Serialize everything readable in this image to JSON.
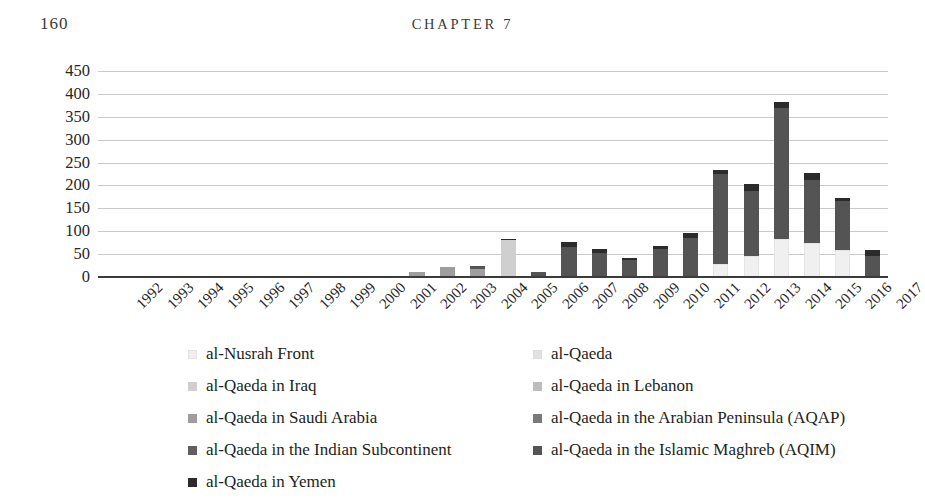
{
  "page": {
    "folio": "160",
    "running_head": "CHAPTER 7"
  },
  "chart_data": {
    "type": "bar",
    "subtype": "stacked-vertical",
    "title": "",
    "subtitle": "",
    "xlabel": "",
    "ylabel": "",
    "ylim": [
      0,
      450
    ],
    "ytick_step": 50,
    "yticks": [
      "450",
      "400",
      "350",
      "300",
      "250",
      "200",
      "150",
      "100",
      "50",
      "0"
    ],
    "grid": true,
    "legend_position": "bottom",
    "legend_columns": 2,
    "categories": [
      "1992",
      "1993",
      "1994",
      "1995",
      "1996",
      "1997",
      "1998",
      "1999",
      "2000",
      "2001",
      "2002",
      "2003",
      "2004",
      "2005",
      "2006",
      "2007",
      "2008",
      "2009",
      "2010",
      "2011",
      "2012",
      "2013",
      "2014",
      "2015",
      "2016",
      "2017"
    ],
    "series": [
      {
        "name": "al-Nusrah Front",
        "color": "#f0f0f0",
        "values": [
          0,
          0,
          0,
          0,
          0,
          0,
          0,
          0,
          0,
          0,
          0,
          0,
          0,
          0,
          0,
          0,
          0,
          0,
          0,
          0,
          28,
          45,
          82,
          74,
          58,
          0
        ]
      },
      {
        "name": "al-Qaeda",
        "color": "#e2e2e2",
        "values": [
          3,
          0,
          0,
          0,
          0,
          0,
          2,
          0,
          1,
          2,
          0,
          0,
          0,
          0,
          0,
          0,
          0,
          0,
          0,
          0,
          0,
          0,
          0,
          0,
          0,
          0
        ]
      },
      {
        "name": "al-Qaeda in Iraq",
        "color": "#cfcfcf",
        "values": [
          0,
          0,
          0,
          0,
          0,
          0,
          0,
          0,
          0,
          0,
          0,
          0,
          0,
          80,
          0,
          0,
          0,
          0,
          0,
          0,
          0,
          0,
          0,
          0,
          0,
          0
        ]
      },
      {
        "name": "al-Qaeda in Lebanon",
        "color": "#bdbdbd",
        "values": [
          0,
          0,
          0,
          0,
          0,
          0,
          0,
          0,
          0,
          0,
          0,
          0,
          0,
          0,
          0,
          0,
          0,
          0,
          0,
          0,
          0,
          0,
          0,
          0,
          0,
          0
        ]
      },
      {
        "name": "al-Qaeda in Saudi Arabia",
        "color": "#9e9e9e",
        "values": [
          0,
          0,
          0,
          0,
          0,
          0,
          0,
          0,
          0,
          0,
          12,
          21,
          18,
          0,
          0,
          0,
          0,
          0,
          0,
          0,
          0,
          0,
          0,
          0,
          0,
          0
        ]
      },
      {
        "name": "al-Qaeda in the Arabian Peninsula (AQAP)",
        "color": "#7a7a7a",
        "values": [
          0,
          0,
          0,
          0,
          0,
          0,
          0,
          0,
          0,
          0,
          0,
          0,
          0,
          0,
          0,
          0,
          0,
          0,
          0,
          0,
          0,
          0,
          0,
          0,
          0,
          0
        ]
      },
      {
        "name": "al-Qaeda in the Indian Subcontinent",
        "color": "#5f5f5f",
        "values": [
          0,
          0,
          0,
          0,
          0,
          0,
          0,
          0,
          0,
          0,
          0,
          0,
          0,
          0,
          0,
          0,
          0,
          0,
          0,
          0,
          0,
          0,
          0,
          0,
          0,
          0
        ]
      },
      {
        "name": "al-Qaeda in the Islamic Maghreb (AQIM)",
        "color": "#545454",
        "values": [
          0,
          0,
          0,
          0,
          0,
          0,
          0,
          0,
          0,
          0,
          0,
          0,
          6,
          0,
          12,
          66,
          52,
          37,
          61,
          85,
          197,
          144,
          288,
          139,
          109,
          47
        ]
      },
      {
        "name": "al-Qaeda in Yemen",
        "color": "#2b2b2b",
        "values": [
          0,
          0,
          0,
          0,
          0,
          0,
          0,
          0,
          0,
          0,
          0,
          0,
          0,
          4,
          0,
          11,
          9,
          4,
          6,
          11,
          9,
          14,
          12,
          14,
          6,
          11
        ]
      }
    ],
    "totals": [
      3,
      0,
      0,
      0,
      0,
      0,
      2,
      0,
      1,
      2,
      12,
      21,
      24,
      84,
      12,
      77,
      61,
      41,
      67,
      96,
      234,
      203,
      382,
      227,
      173,
      58
    ],
    "annotations": []
  },
  "legend": {
    "left_column": [
      {
        "label": "al-Nusrah Front",
        "color": "#f0f0f0"
      },
      {
        "label": "al-Qaeda in Iraq",
        "color": "#cfcfcf"
      },
      {
        "label": "al-Qaeda in Saudi Arabia",
        "color": "#9e9e9e"
      },
      {
        "label": "al-Qaeda in the Indian Subcontinent",
        "color": "#5f5f5f"
      },
      {
        "label": "al-Qaeda in Yemen",
        "color": "#2b2b2b"
      }
    ],
    "right_column": [
      {
        "label": "al-Qaeda",
        "color": "#e2e2e2"
      },
      {
        "label": "al-Qaeda in Lebanon",
        "color": "#bdbdbd"
      },
      {
        "label": "al-Qaeda in the Arabian Peninsula (AQAP)",
        "color": "#7a7a7a"
      },
      {
        "label": "al-Qaeda in the Islamic Maghreb (AQIM)",
        "color": "#545454"
      }
    ]
  },
  "colors": {
    "gridline": "#c9c9c9",
    "axis": "#3b3b3b",
    "text": "#231f20",
    "background": "#ffffff"
  }
}
